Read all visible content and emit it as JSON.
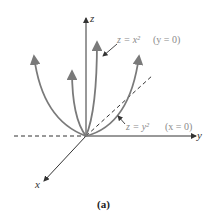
{
  "figure": {
    "caption": "(a)",
    "axes": {
      "x_label": "x",
      "y_label": "y",
      "z_label": "z"
    },
    "annotations": [
      {
        "id": "xz-parabola",
        "equation": "z = x²",
        "condition": "(y = 0)"
      },
      {
        "id": "yz-parabola",
        "equation": "z = y²",
        "condition": "(x = 0)"
      }
    ],
    "colors": {
      "curve": "#7a7a7a",
      "axis": "#333333",
      "label": "#8a8a8a"
    }
  }
}
